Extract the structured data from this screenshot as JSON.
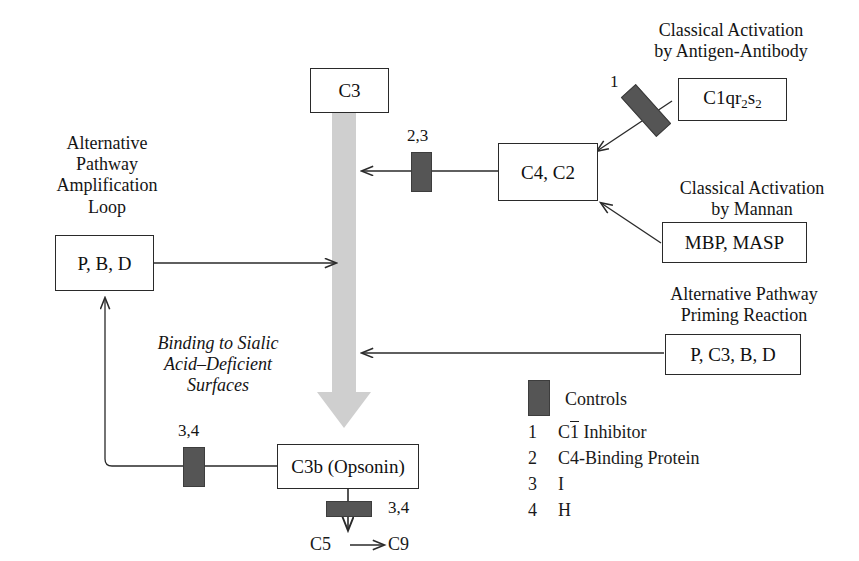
{
  "diagram": {
    "colors": {
      "control_bar": "#555555",
      "gray_arrow": "#c9c9c9",
      "line": "#2a2a2a",
      "background": "#ffffff"
    },
    "nodes": [
      {
        "id": "c3",
        "label": "C3"
      },
      {
        "id": "c1qr2s2",
        "label": "C1qr2s2",
        "rich": "C1qr<sub>2</sub>s<sub>2</sub>"
      },
      {
        "id": "c4c2",
        "label": "C4, C2"
      },
      {
        "id": "mbpmasp",
        "label": "MBP, MASP"
      },
      {
        "id": "pbd",
        "label": "P, B, D"
      },
      {
        "id": "pc3bd",
        "label": "P, C3, B, D"
      },
      {
        "id": "c3b",
        "label": "C3b (Opsonin)"
      }
    ],
    "captions": [
      {
        "id": "classical-antigen",
        "text": "Classical Activation\nby Antigen-Antibody"
      },
      {
        "id": "classical-mannan",
        "text": "Classical Activation\nby Mannan"
      },
      {
        "id": "alt-priming",
        "text": "Alternative Pathway\nPriming Reaction"
      },
      {
        "id": "alt-amplification",
        "text": "Alternative\nPathway\nAmplification\nLoop"
      },
      {
        "id": "sialic-binding",
        "text": "Binding to Sialic\nAcid–Deficient\nSurfaces",
        "italic": true
      }
    ],
    "control_labels": [
      {
        "id": "ctl-1",
        "text": "1"
      },
      {
        "id": "ctl-23",
        "text": "2,3"
      },
      {
        "id": "ctl-34-a",
        "text": "3,4"
      },
      {
        "id": "ctl-34-b",
        "text": "3,4"
      }
    ],
    "terminal": {
      "from": "C5",
      "to": "C9",
      "arrow": "→"
    },
    "legend": {
      "title": "Controls",
      "rows": [
        {
          "index": "1",
          "name": "C1 Inhibitor",
          "overbar_char": "1",
          "prefix": "C",
          "suffix": " Inhibitor"
        },
        {
          "index": "2",
          "name": "C4-Binding Protein"
        },
        {
          "index": "3",
          "name": "I"
        },
        {
          "index": "4",
          "name": "H"
        }
      ]
    }
  }
}
